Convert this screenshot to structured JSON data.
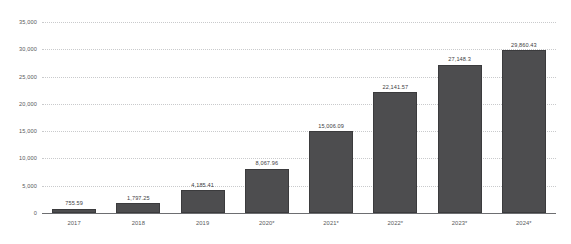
{
  "chart_data": {
    "type": "bar",
    "title": "",
    "subtitle": "",
    "xlabel": "",
    "ylabel": "",
    "ylim": [
      0,
      35000
    ],
    "grid": true,
    "legend": false,
    "bar_color": "#4d4d4f",
    "categories": [
      "2017",
      "2018",
      "2019",
      "2020*",
      "2021*",
      "2022*",
      "2023*",
      "2024*"
    ],
    "values": [
      755.59,
      1797.25,
      4185.41,
      8067.96,
      15006.09,
      22141.57,
      27148.3,
      29860.43
    ],
    "value_labels": [
      "755.59",
      "1,797.25",
      "4,185.41",
      "8,067.96",
      "15,006.09",
      "22,141.57",
      "27,148.3",
      "29,860.43"
    ],
    "y_ticks": [
      0,
      5000,
      10000,
      15000,
      20000,
      25000,
      30000,
      35000
    ],
    "y_tick_labels": [
      "0",
      "5,000",
      "10,000",
      "15,000",
      "20,000",
      "25,000",
      "30,000",
      "35,000"
    ]
  }
}
